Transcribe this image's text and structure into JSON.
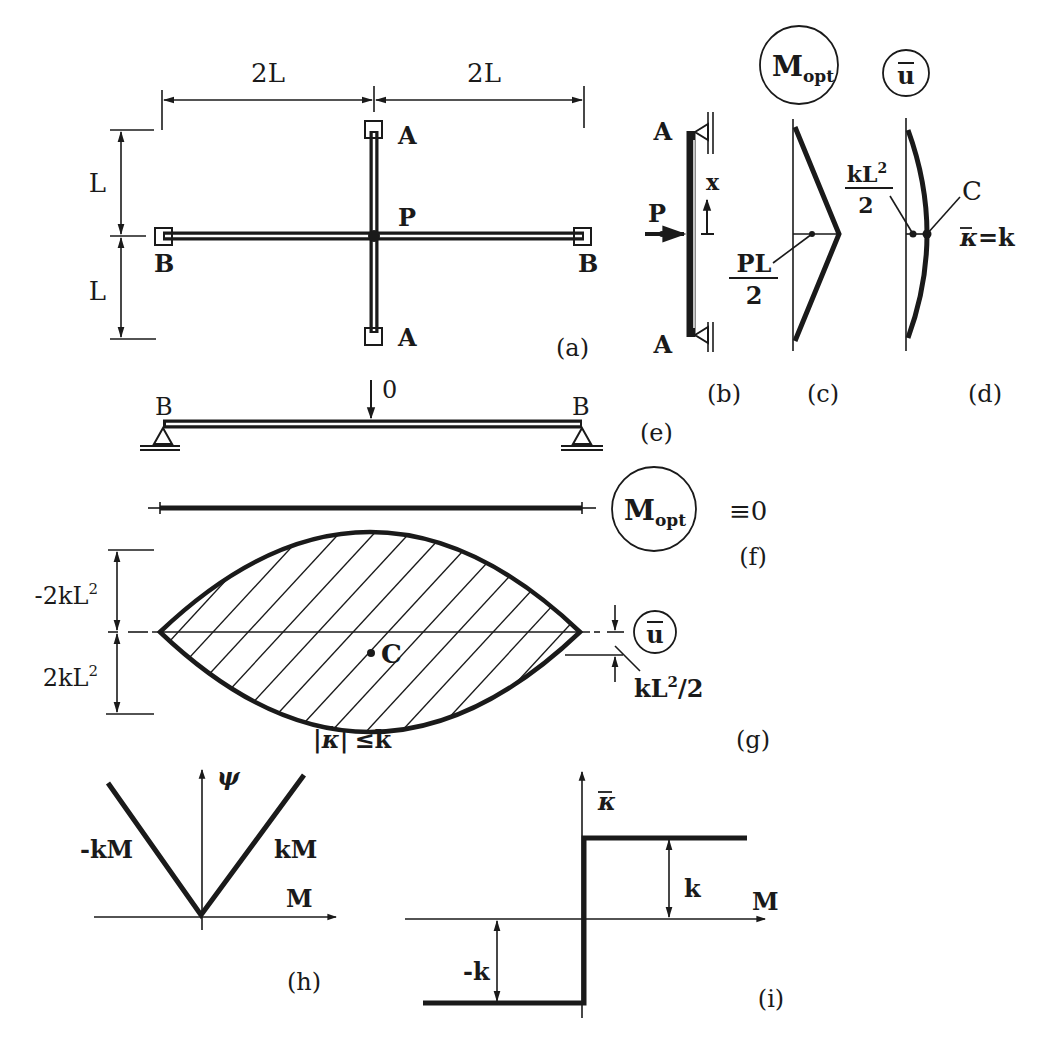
{
  "figure": {
    "panels": {
      "a": {
        "label": "(a)",
        "dim_horizontal_left": "2L",
        "dim_horizontal_right": "2L",
        "dim_vertical_top": "L",
        "dim_vertical_bottom": "L",
        "support_top": "A",
        "support_bottom": "A",
        "support_left": "B",
        "support_right": "B",
        "load_point": "P"
      },
      "b": {
        "label": "(b)",
        "support_top": "A",
        "support_bottom": "A",
        "load": "P",
        "axis": "x"
      },
      "c": {
        "label": "(c)",
        "title_main": "M",
        "title_sub": "opt",
        "value_num": "PL",
        "value_den": "2"
      },
      "d": {
        "label": "(d)",
        "title": "u",
        "value_num": "kL",
        "value_num_sup": "2",
        "value_den": "2",
        "point": "C",
        "curvature_lhs": "κ",
        "curvature_rhs": "=k"
      },
      "e": {
        "label": "(e)",
        "support_left": "B",
        "support_right": "B",
        "load": "0"
      },
      "f": {
        "label": "(f)",
        "title_main": "M",
        "title_sub": "opt",
        "identity": "≡0"
      },
      "g": {
        "label": "(g)",
        "dim_top": "-2kL",
        "dim_top_sup": "2",
        "dim_bottom": "2kL",
        "dim_bottom_sup": "2",
        "point": "C",
        "title": "u",
        "offset_main": "kL",
        "offset_sup": "2",
        "offset_tail": "/2",
        "constraint_lhs": "|κ|",
        "constraint_rhs": "≤k"
      },
      "h": {
        "label": "(h)",
        "y_axis": "ψ",
        "x_axis": "M",
        "left_branch": "-kM",
        "right_branch": "kM"
      },
      "i": {
        "label": "(i)",
        "y_axis": "κ",
        "x_axis": "M",
        "upper_level": "k",
        "lower_level": "-k"
      }
    }
  }
}
